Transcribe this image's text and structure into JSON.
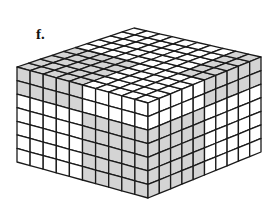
{
  "figure": {
    "label": "f.",
    "grid": {
      "width_cells": 10,
      "depth_cells": 10,
      "height_cells": 7
    },
    "colors": {
      "shaded": "#d4d4d4",
      "unshaded": "#ffffff",
      "line": "#1a1a1a"
    },
    "corners": {
      "left_top": [
        17,
        67
      ],
      "front_top": [
        148,
        103
      ],
      "right_top": [
        261,
        57
      ],
      "back_top": [
        134,
        28
      ],
      "height": 95
    },
    "left_face_shaded": [
      [
        0,
        0
      ],
      [
        1,
        0
      ],
      [
        2,
        0
      ],
      [
        3,
        0
      ],
      [
        4,
        0
      ],
      [
        0,
        1
      ],
      [
        1,
        1
      ],
      [
        2,
        1
      ],
      [
        3,
        1
      ],
      [
        4,
        1
      ],
      [
        5,
        2
      ],
      [
        6,
        2
      ],
      [
        7,
        2
      ],
      [
        8,
        2
      ],
      [
        9,
        2
      ],
      [
        5,
        3
      ],
      [
        6,
        3
      ],
      [
        7,
        3
      ],
      [
        8,
        3
      ],
      [
        9,
        3
      ],
      [
        5,
        4
      ],
      [
        6,
        4
      ],
      [
        7,
        4
      ],
      [
        8,
        4
      ],
      [
        9,
        4
      ],
      [
        5,
        5
      ],
      [
        6,
        5
      ],
      [
        7,
        5
      ],
      [
        8,
        5
      ],
      [
        9,
        5
      ],
      [
        5,
        6
      ],
      [
        6,
        6
      ],
      [
        7,
        6
      ],
      [
        8,
        6
      ],
      [
        9,
        6
      ]
    ],
    "right_face_shaded": [
      [
        5,
        0
      ],
      [
        6,
        0
      ],
      [
        7,
        0
      ],
      [
        8,
        0
      ],
      [
        9,
        0
      ],
      [
        5,
        1
      ],
      [
        6,
        1
      ],
      [
        7,
        1
      ],
      [
        8,
        1
      ],
      [
        9,
        1
      ],
      [
        0,
        2
      ],
      [
        1,
        2
      ],
      [
        2,
        2
      ],
      [
        3,
        2
      ],
      [
        4,
        2
      ],
      [
        0,
        3
      ],
      [
        1,
        3
      ],
      [
        2,
        3
      ],
      [
        3,
        3
      ],
      [
        4,
        3
      ],
      [
        0,
        4
      ],
      [
        1,
        4
      ],
      [
        2,
        4
      ],
      [
        3,
        4
      ],
      [
        4,
        4
      ],
      [
        0,
        5
      ],
      [
        1,
        5
      ],
      [
        2,
        5
      ],
      [
        3,
        5
      ],
      [
        4,
        5
      ],
      [
        0,
        6
      ],
      [
        1,
        6
      ],
      [
        2,
        6
      ],
      [
        3,
        6
      ],
      [
        4,
        6
      ]
    ],
    "top_face_shaded": [
      [
        0,
        0
      ],
      [
        1,
        0
      ],
      [
        2,
        0
      ],
      [
        3,
        0
      ],
      [
        4,
        0
      ],
      [
        0,
        1
      ],
      [
        1,
        1
      ],
      [
        2,
        1
      ],
      [
        3,
        1
      ],
      [
        4,
        1
      ],
      [
        0,
        2
      ],
      [
        1,
        2
      ],
      [
        2,
        2
      ],
      [
        3,
        2
      ],
      [
        4,
        2
      ],
      [
        0,
        3
      ],
      [
        1,
        3
      ],
      [
        2,
        3
      ],
      [
        3,
        3
      ],
      [
        4,
        3
      ],
      [
        0,
        4
      ],
      [
        1,
        4
      ],
      [
        2,
        4
      ],
      [
        3,
        4
      ],
      [
        4,
        4
      ],
      [
        9,
        5
      ],
      [
        9,
        6
      ],
      [
        9,
        7
      ],
      [
        9,
        8
      ],
      [
        9,
        9
      ],
      [
        8,
        5
      ],
      [
        8,
        6
      ],
      [
        8,
        7
      ],
      [
        8,
        8
      ],
      [
        8,
        9
      ]
    ]
  }
}
